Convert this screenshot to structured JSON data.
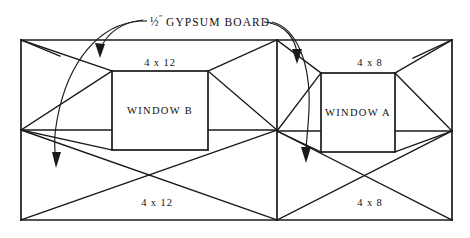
{
  "diagram": {
    "type": "engineering-framing-elevation",
    "title_label": {
      "fraction": "½",
      "inch_mark": "″",
      "text": "GYPSUM BOARD",
      "full_text": "½″ GYPSUM BOARD"
    },
    "canvas": {
      "width": 470,
      "height": 238,
      "background": "#ffffff"
    },
    "colors": {
      "ink": "#1a1a1a",
      "text": "#111111",
      "paper": "#ffffff"
    },
    "outer_frame": {
      "name": "wall-outline",
      "left": 21,
      "right": 452,
      "top": 40,
      "bottom": 220,
      "mid_y": 130
    },
    "center_post": {
      "x": 277,
      "top": 40,
      "bottom": 220
    },
    "panels": [
      {
        "id": "panel-left",
        "dimension_top": "4 x 12",
        "dimension_bottom": "4 x 12",
        "window_label": "WINDOW B",
        "window": {
          "x": 112,
          "y": 71,
          "width": 96,
          "height": 79
        }
      },
      {
        "id": "panel-right",
        "dimension_top": "4 x 8",
        "dimension_bottom": "4 x 8",
        "window_label": "WINDOW A",
        "window": {
          "x": 321,
          "y": 73,
          "width": 74,
          "height": 79
        }
      }
    ],
    "label_positions": {
      "title": {
        "x": 148,
        "y": 26
      },
      "dim_top_left": {
        "x": 160,
        "y": 66
      },
      "dim_top_right": {
        "x": 370,
        "y": 66
      },
      "dim_bottom_left": {
        "x": 157,
        "y": 206
      },
      "dim_bottom_right": {
        "x": 370,
        "y": 206
      },
      "window_left": {
        "x": 160,
        "y": 114
      },
      "window_right": {
        "x": 358,
        "y": 116
      }
    },
    "leaders": [
      {
        "name": "leader-left-long",
        "target": "left-panel-sheathing"
      },
      {
        "name": "leader-left-short",
        "target": "left-panel-upper"
      },
      {
        "name": "leader-right-short",
        "target": "right-panel-upper"
      },
      {
        "name": "leader-right-long",
        "target": "right-panel-sheathing"
      }
    ]
  }
}
